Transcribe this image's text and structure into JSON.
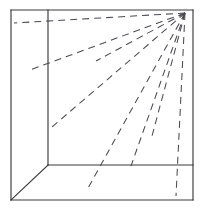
{
  "figure": {
    "type": "line-diagram",
    "canvas": {
      "width": 204,
      "height": 216
    },
    "background_color": "#ffffff",
    "line_color": "#3a3a3a",
    "dash_color": "#4a4a52",
    "vanishing_point": {
      "x": 185,
      "y": 13
    },
    "outer_frame": {
      "label": "picture-plane-border",
      "left": 11,
      "top": 10,
      "right": 193,
      "bottom": 200
    },
    "solid_edges": [
      {
        "name": "frame-top",
        "x1": 11,
        "y1": 10,
        "x2": 193,
        "y2": 10
      },
      {
        "name": "frame-right",
        "x1": 193,
        "y1": 10,
        "x2": 193,
        "y2": 200
      },
      {
        "name": "frame-bottom",
        "x1": 193,
        "y1": 200,
        "x2": 11,
        "y2": 200
      },
      {
        "name": "frame-left",
        "x1": 11,
        "y1": 200,
        "x2": 11,
        "y2": 10
      },
      {
        "name": "wall-corner-vertical",
        "x1": 48,
        "y1": 10,
        "x2": 48,
        "y2": 165
      },
      {
        "name": "floor-back-edge",
        "x1": 48,
        "y1": 165,
        "x2": 193,
        "y2": 165
      },
      {
        "name": "floor-left-diagonal",
        "x1": 48,
        "y1": 165,
        "x2": 11,
        "y2": 200
      }
    ],
    "dashed_rays": [
      {
        "name": "ray-1",
        "x1": 185,
        "y1": 13,
        "x2": 14,
        "y2": 23,
        "dash": "7 5"
      },
      {
        "name": "ray-2",
        "x1": 185,
        "y1": 13,
        "x2": 30,
        "y2": 70,
        "dash": "7 5"
      },
      {
        "name": "ray-3",
        "x1": 185,
        "y1": 13,
        "x2": 96,
        "y2": 61,
        "dash": "7 5"
      },
      {
        "name": "ray-4",
        "x1": 185,
        "y1": 13,
        "x2": 52,
        "y2": 127,
        "dash": "7 5"
      },
      {
        "name": "ray-5",
        "x1": 185,
        "y1": 13,
        "x2": 87,
        "y2": 190,
        "dash": "7 5"
      },
      {
        "name": "ray-6",
        "x1": 185,
        "y1": 13,
        "x2": 131,
        "y2": 166,
        "dash": "7 5"
      },
      {
        "name": "ray-7",
        "x1": 185,
        "y1": 13,
        "x2": 152,
        "y2": 136,
        "dash": "7 5"
      },
      {
        "name": "ray-8",
        "x1": 185,
        "y1": 13,
        "x2": 176,
        "y2": 196,
        "dash": "7 5"
      }
    ]
  }
}
